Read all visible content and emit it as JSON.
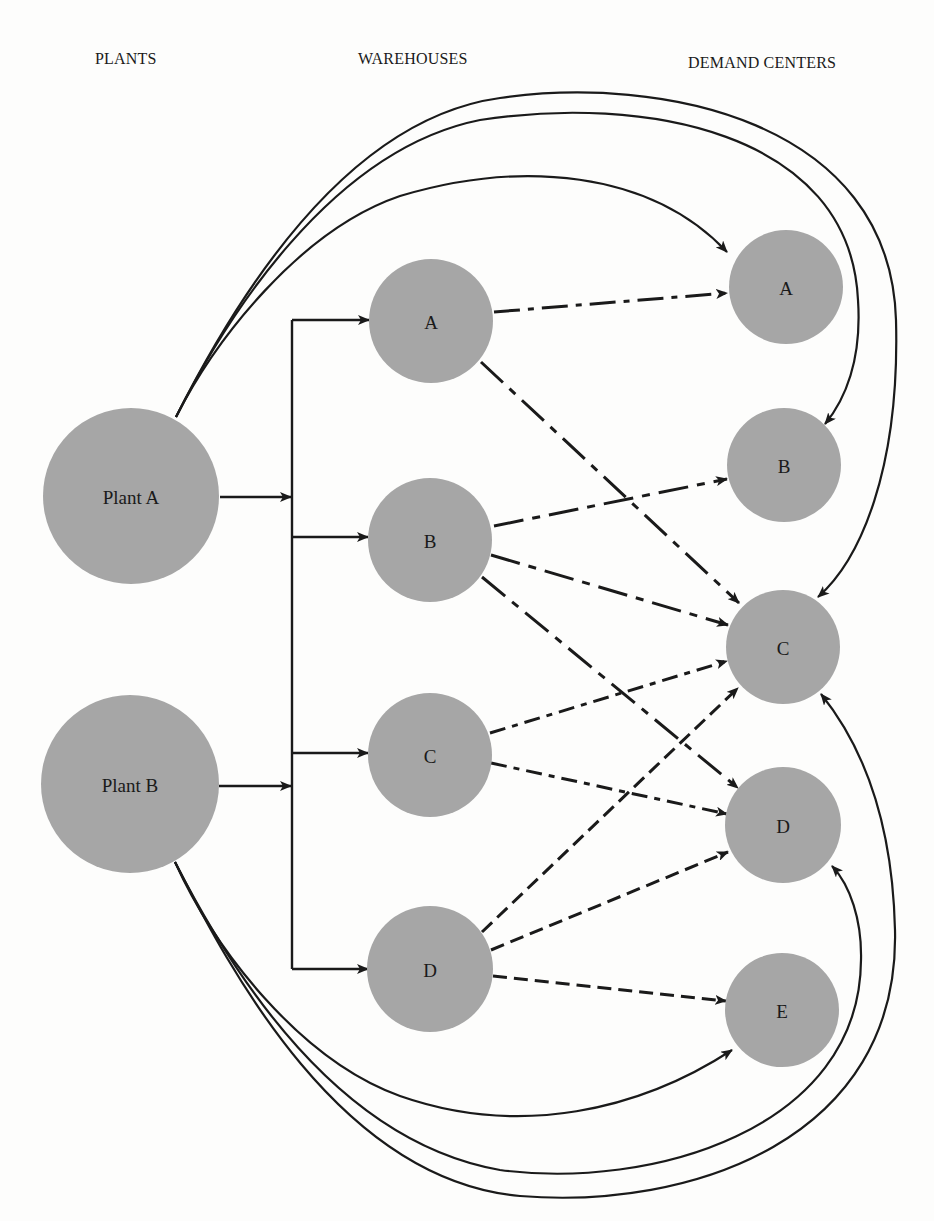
{
  "headers": {
    "plants": "PLANTS",
    "warehouses": "WAREHOUSES",
    "demand_centers": "DEMAND CENTERS"
  },
  "colors": {
    "node_fill": "#a6a6a6",
    "line": "#1a1a1a",
    "background": "#fdfdfc"
  },
  "plants": [
    {
      "id": "PA",
      "label": "Plant A",
      "cx": 131,
      "cy": 496,
      "r": 88
    },
    {
      "id": "PB",
      "label": "Plant B",
      "cx": 130,
      "cy": 784,
      "r": 89
    }
  ],
  "warehouses": [
    {
      "id": "WA",
      "label": "A",
      "cx": 431,
      "cy": 321,
      "r": 62
    },
    {
      "id": "WB",
      "label": "B",
      "cx": 430,
      "cy": 540,
      "r": 62
    },
    {
      "id": "WC",
      "label": "C",
      "cx": 430,
      "cy": 755,
      "r": 62
    },
    {
      "id": "WD",
      "label": "D",
      "cx": 430,
      "cy": 969,
      "r": 63
    }
  ],
  "demand_centers": [
    {
      "id": "DA",
      "label": "A",
      "cx": 786,
      "cy": 287,
      "r": 57
    },
    {
      "id": "DB",
      "label": "B",
      "cx": 784,
      "cy": 465,
      "r": 57
    },
    {
      "id": "DC",
      "label": "C",
      "cx": 783,
      "cy": 647,
      "r": 57
    },
    {
      "id": "DD",
      "label": "D",
      "cx": 783,
      "cy": 825,
      "r": 58
    },
    {
      "id": "DE",
      "label": "E",
      "cx": 782,
      "cy": 1010,
      "r": 57
    }
  ],
  "bus": {
    "x": 292,
    "y_top": 320,
    "y_bottom": 969,
    "inputs": [
      {
        "from": "PA",
        "x1": 220,
        "y": 497
      },
      {
        "from": "PB",
        "x1": 219,
        "y": 786
      }
    ],
    "outputs": [
      {
        "to": "WA",
        "y": 320,
        "x2": 369
      },
      {
        "to": "WB",
        "y": 537,
        "x2": 368
      },
      {
        "to": "WC",
        "y": 753,
        "x2": 368
      },
      {
        "to": "WD",
        "y": 969,
        "x2": 368
      }
    ]
  },
  "direct_shipments": [
    {
      "from": "PA",
      "to": "DA",
      "path": "M176,417 C215,340 300,230 400,196 C520,160 650,170 727,252"
    },
    {
      "from": "PA",
      "to": "DB",
      "path": "M176,417 C225,320 330,150 480,120 C640,95 850,130 858,300 C862,360 845,400 825,424"
    },
    {
      "from": "PA",
      "to": "DC",
      "path": "M176,417 C230,310 340,120 500,98 C660,75 890,120 896,320 C900,470 860,560 818,597"
    },
    {
      "from": "PB",
      "to": "DE",
      "path": "M175,862 C215,950 300,1060 400,1096 C520,1138 640,1110 732,1050"
    },
    {
      "from": "PB",
      "to": "DD",
      "path": "M175,862 C225,960 330,1140 500,1170 C650,1190 860,1130 861,960 C862,920 850,885 832,866"
    },
    {
      "from": "PB",
      "to": "DC",
      "path": "M175,862 C230,970 340,1180 520,1196 C690,1210 900,1140 895,930 C892,800 850,730 821,694"
    }
  ],
  "warehouse_shipments": [
    {
      "from": "WA",
      "to": "DA",
      "x1": 494,
      "y1": 312,
      "x2": 727,
      "y2": 293,
      "dash": "26 8 6 8"
    },
    {
      "from": "WA",
      "to": "DC",
      "x1": 481,
      "y1": 362,
      "x2": 739,
      "y2": 603,
      "dash": "30 9 8 9"
    },
    {
      "from": "WB",
      "to": "DB",
      "x1": 494,
      "y1": 526,
      "x2": 727,
      "y2": 479,
      "dash": "30 9 8 9"
    },
    {
      "from": "WB",
      "to": "DC",
      "x1": 491,
      "y1": 555,
      "x2": 728,
      "y2": 625,
      "dash": "30 9 8 9"
    },
    {
      "from": "WB",
      "to": "DD",
      "x1": 482,
      "y1": 577,
      "x2": 738,
      "y2": 788,
      "dash": "30 9 8 9"
    },
    {
      "from": "WC",
      "to": "DC",
      "x1": 490,
      "y1": 733,
      "x2": 727,
      "y2": 661,
      "dash": "16 7 6 7"
    },
    {
      "from": "WC",
      "to": "DD",
      "x1": 491,
      "y1": 763,
      "x2": 727,
      "y2": 814,
      "dash": "16 7 6 7"
    },
    {
      "from": "WD",
      "to": "DC",
      "x1": 482,
      "y1": 932,
      "x2": 738,
      "y2": 688,
      "dash": "14 7"
    },
    {
      "from": "WD",
      "to": "DD",
      "x1": 491,
      "y1": 950,
      "x2": 728,
      "y2": 852,
      "dash": "14 7"
    },
    {
      "from": "WD",
      "to": "DE",
      "x1": 493,
      "y1": 976,
      "x2": 726,
      "y2": 1001,
      "dash": "14 7"
    }
  ]
}
